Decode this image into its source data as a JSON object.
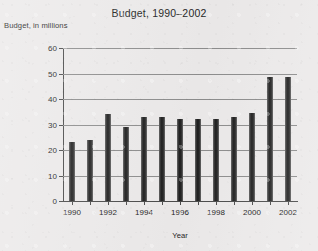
{
  "chart_data": {
    "type": "bar",
    "title": "Budget, 1990–2002",
    "xlabel": "Year",
    "ylabel": "Budget, in millions",
    "categories": [
      "1990",
      "1991",
      "1992",
      "1993",
      "1994",
      "1995",
      "1996",
      "1997",
      "1998",
      "1999",
      "2000",
      "2001",
      "2002"
    ],
    "values": [
      23,
      24,
      34,
      29,
      33,
      33,
      32,
      32,
      32,
      33,
      34.5,
      48.5,
      48.5
    ],
    "ylim": [
      0,
      60
    ],
    "yticks": [
      0,
      10,
      20,
      30,
      40,
      50,
      60
    ],
    "ytick_labels": [
      "0",
      "10",
      "20",
      "30",
      "40",
      "50",
      "60"
    ],
    "xtick_labels": [
      "1990",
      "",
      "1992",
      "",
      "1994",
      "",
      "1996",
      "",
      "1998",
      "",
      "2000",
      "",
      "2002"
    ],
    "grid": "horizontal",
    "legend": "none",
    "bar_color": "#1c1c1c"
  },
  "colors": {
    "background": "#eceaea",
    "axis": "#4a4a4a",
    "gridline": "#8d8d8d",
    "text": "#232323"
  }
}
